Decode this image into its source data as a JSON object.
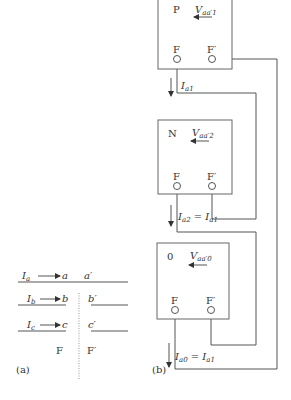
{
  "panel_a": {
    "caption": "(a)",
    "rows": [
      {
        "current": "I",
        "current_sub": "a",
        "node": "a",
        "node_prime": "a′"
      },
      {
        "current": "I",
        "current_sub": "b",
        "node": "b",
        "node_prime": "b′"
      },
      {
        "current": "I",
        "current_sub": "c",
        "node": "c",
        "node_prime": "c′"
      }
    ],
    "fault_left": "F",
    "fault_right": "F′"
  },
  "panel_b": {
    "caption": "(b)",
    "networks": [
      {
        "name": "P",
        "voltage": "V",
        "voltage_sub": "aa′1",
        "term_f": "F",
        "term_fp": "F′"
      },
      {
        "name": "N",
        "voltage": "V",
        "voltage_sub": "aa′2",
        "term_f": "F",
        "term_fp": "F′"
      },
      {
        "name": "0",
        "voltage": "V",
        "voltage_sub": "aa′0",
        "term_f": "F",
        "term_fp": "F′"
      }
    ],
    "currents": [
      {
        "main": "I",
        "sub": "a1",
        "eq": ""
      },
      {
        "main": "I",
        "sub": "a2",
        "eq": " = I",
        "eq_sub": "a1"
      },
      {
        "main": "I",
        "sub": "a0",
        "eq": " = I",
        "eq_sub": "a1"
      }
    ]
  }
}
